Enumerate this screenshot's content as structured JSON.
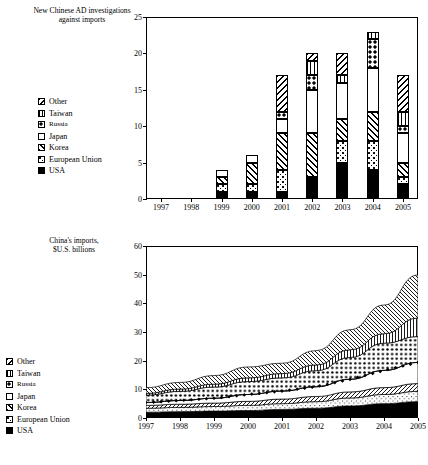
{
  "figure": {
    "width": 428,
    "height": 465,
    "background": "#ffffff",
    "ink": "#000000"
  },
  "top_panel": {
    "title": "New Chinese AD investigations\nagainst imports",
    "legend_title": "",
    "legend_items": [
      {
        "label": "Other",
        "pattern": "diagonal-backslash"
      },
      {
        "label": "Taiwan",
        "pattern": "vertical-lines"
      },
      {
        "label": "Russia",
        "pattern": "large-dots"
      },
      {
        "label": "Japan",
        "pattern": "solid-white"
      },
      {
        "label": "Korea",
        "pattern": "diagonal-slash"
      },
      {
        "label": "European Union",
        "pattern": "fine-dots"
      },
      {
        "label": "USA",
        "pattern": "solid-black"
      }
    ]
  },
  "bottom_panel": {
    "title": "China's imports,\n$U.S. billions",
    "legend_items": [
      {
        "label": "Other",
        "pattern": "diagonal-backslash"
      },
      {
        "label": "Taiwan",
        "pattern": "vertical-lines"
      },
      {
        "label": "Russia",
        "pattern": "large-dots"
      },
      {
        "label": "Japan",
        "pattern": "solid-white"
      },
      {
        "label": "Korea",
        "pattern": "diagonal-slash"
      },
      {
        "label": "European Union",
        "pattern": "fine-dots"
      },
      {
        "label": "USA",
        "pattern": "solid-black"
      }
    ]
  },
  "chart_data": [
    {
      "id": "ad-investigations",
      "type": "bar",
      "stacked": true,
      "title": "New Chinese AD investigations against imports",
      "xlabel": "",
      "ylabel": "",
      "ylim": [
        0,
        25
      ],
      "yticks": [
        0,
        5,
        10,
        15,
        20,
        25
      ],
      "grid": false,
      "legend_position": "left-outside",
      "categories": [
        "1997",
        "1998",
        "1999",
        "2000",
        "2001",
        "2002",
        "2003",
        "2004",
        "2005"
      ],
      "series": [
        {
          "name": "USA",
          "values": [
            0,
            0,
            1,
            1,
            1,
            3,
            5,
            4,
            2
          ]
        },
        {
          "name": "European Union",
          "values": [
            0,
            0,
            1,
            1,
            3,
            0,
            3,
            4,
            1
          ]
        },
        {
          "name": "Korea",
          "values": [
            0,
            0,
            1,
            3,
            5,
            6,
            3,
            4,
            2
          ]
        },
        {
          "name": "Japan",
          "values": [
            0,
            0,
            1,
            1,
            2,
            6,
            5,
            6,
            4
          ]
        },
        {
          "name": "Russia",
          "values": [
            0,
            0,
            0,
            0,
            1,
            2,
            0,
            4,
            1
          ]
        },
        {
          "name": "Taiwan",
          "values": [
            0,
            0,
            0,
            0,
            0,
            2,
            1,
            1,
            2
          ]
        },
        {
          "name": "Other",
          "values": [
            0,
            0,
            0,
            0,
            5,
            1,
            3,
            0,
            5
          ]
        }
      ],
      "totals": [
        0,
        0,
        4,
        6,
        17,
        20,
        20,
        23,
        17
      ]
    },
    {
      "id": "china-imports",
      "type": "area",
      "stacked": true,
      "title": "China's imports, $U.S. billions",
      "xlabel": "",
      "ylabel": "$U.S. billions",
      "ylim": [
        0,
        60
      ],
      "yticks": [
        0,
        10,
        20,
        30,
        40,
        50,
        60
      ],
      "grid": false,
      "legend_position": "left-outside",
      "x": [
        "1997",
        "1998",
        "1999",
        "2000",
        "2001",
        "2002",
        "2003",
        "2004",
        "2005"
      ],
      "series": [
        {
          "name": "USA",
          "values": [
            2.0,
            2.2,
            2.4,
            2.6,
            3.0,
            3.4,
            4.2,
            5.0,
            5.7
          ]
        },
        {
          "name": "European Union",
          "values": [
            1.4,
            1.5,
            1.6,
            1.8,
            2.0,
            2.3,
            2.8,
            3.2,
            3.6
          ]
        },
        {
          "name": "Korea",
          "values": [
            1.0,
            1.1,
            1.2,
            1.4,
            1.6,
            1.8,
            2.1,
            2.4,
            2.7
          ]
        },
        {
          "name": "Japan",
          "values": [
            1.0,
            1.3,
            1.7,
            2.4,
            2.8,
            3.4,
            4.4,
            6.0,
            7.4
          ]
        },
        {
          "name": "Russia",
          "values": [
            2.6,
            3.2,
            3.9,
            4.5,
            4.6,
            5.6,
            7.6,
            9.5,
            9.0
          ]
        },
        {
          "name": "Taiwan",
          "values": [
            0.6,
            0.8,
            1.0,
            1.3,
            1.5,
            2.0,
            2.7,
            3.3,
            6.5
          ]
        },
        {
          "name": "Other",
          "values": [
            2.0,
            2.3,
            3.0,
            3.8,
            3.6,
            5.0,
            7.0,
            10.0,
            15.0
          ]
        }
      ],
      "totals": [
        10.6,
        12.4,
        14.8,
        17.8,
        19.1,
        23.5,
        30.8,
        39.4,
        49.9
      ]
    }
  ],
  "axes": {
    "top_yticks": [
      "0",
      "5",
      "10",
      "15",
      "20",
      "25"
    ],
    "bottom_yticks": [
      "0",
      "10",
      "20",
      "30",
      "40",
      "50",
      "60"
    ],
    "xticks": [
      "1997",
      "1998",
      "1999",
      "2000",
      "2001",
      "2002",
      "2003",
      "2004",
      "2005"
    ]
  }
}
